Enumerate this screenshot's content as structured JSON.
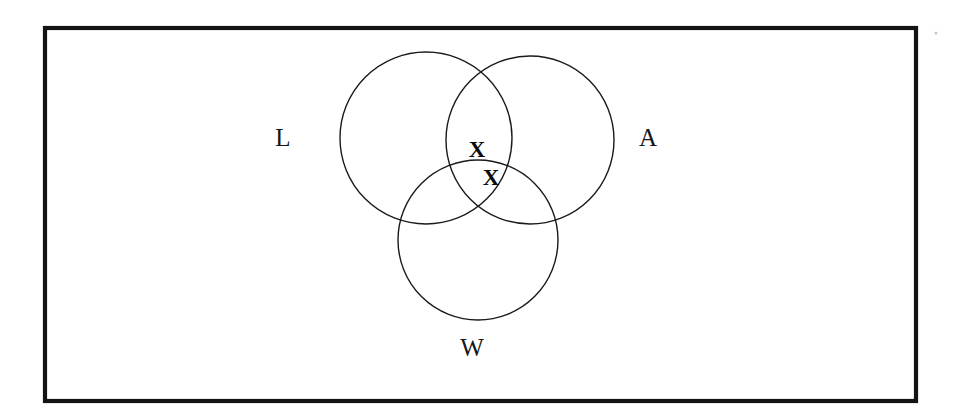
{
  "diagram": {
    "type": "venn-diagram",
    "sets_count": 3,
    "universe": {
      "name": "universal-set-rectangle",
      "label": "",
      "x": 45,
      "y": 28,
      "width": 871,
      "height": 373,
      "stroke_color": "#141414"
    },
    "sets": [
      {
        "id": "L",
        "label": "L",
        "label_x": 283,
        "label_y": 140,
        "circle_cx": 426,
        "circle_cy": 138,
        "circle_r": 86,
        "stroke_color": "#1a1a1a"
      },
      {
        "id": "A",
        "label": "A",
        "label_x": 648,
        "label_y": 140,
        "circle_cx": 530,
        "circle_cy": 140,
        "circle_r": 84,
        "stroke_color": "#1a1a1a"
      },
      {
        "id": "W",
        "label": "W",
        "label_x": 472,
        "label_y": 350,
        "circle_cx": 478,
        "circle_cy": 240,
        "circle_r": 80,
        "stroke_color": "#1a1a1a"
      }
    ],
    "marks": [
      {
        "id": "mark-1",
        "symbol": "X",
        "x": 477,
        "y": 152,
        "region": "L and A only",
        "color": "#0a0a0a"
      },
      {
        "id": "mark-2",
        "symbol": "X",
        "x": 491,
        "y": 180,
        "region": "L and A and W",
        "color": "#0a0a0a"
      }
    ],
    "artifacts": [
      {
        "id": "speck-1",
        "x": 936,
        "y": 33,
        "r": 1.6
      }
    ]
  }
}
